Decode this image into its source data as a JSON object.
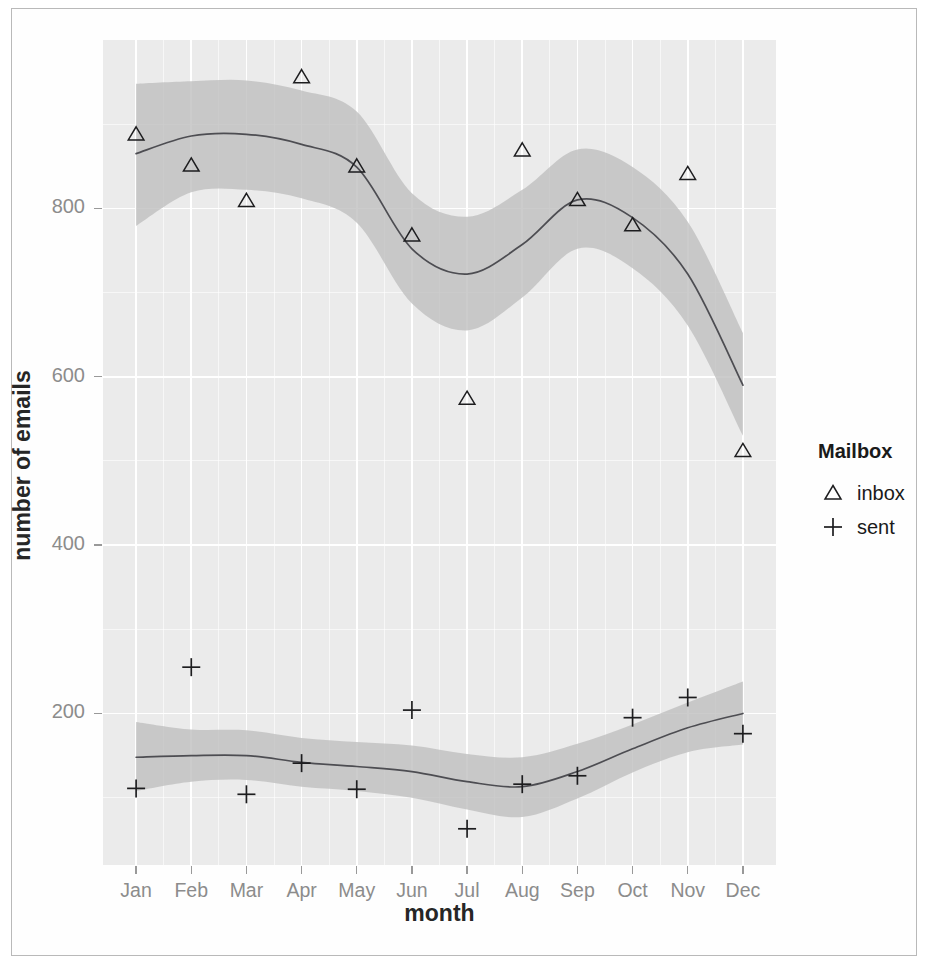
{
  "chart_data": {
    "type": "scatter",
    "title": "",
    "xlabel": "month",
    "ylabel": "number of emails",
    "categories": [
      "Jan",
      "Feb",
      "Mar",
      "Apr",
      "May",
      "Jun",
      "Jul",
      "Aug",
      "Sep",
      "Oct",
      "Nov",
      "Dec"
    ],
    "x_tick_labels": [
      "Jan",
      "Feb",
      "Mar",
      "Apr",
      "May",
      "Jun",
      "Jul",
      "Aug",
      "Sep",
      "Oct",
      "Nov",
      "Dec"
    ],
    "y_tick_labels": [
      "200",
      "400",
      "600",
      "800"
    ],
    "y_ticks": [
      200,
      400,
      600,
      800
    ],
    "ylim": [
      20,
      1000
    ],
    "xlim": [
      0.4,
      12.6
    ],
    "grid": true,
    "legend_position": "right",
    "legend_title": "Mailbox",
    "series": [
      {
        "name": "inbox",
        "marker": "triangle",
        "values": [
          888,
          851,
          809,
          956,
          850,
          768,
          574,
          869,
          810,
          780,
          841,
          512
        ],
        "smooth": [
          865,
          886,
          888,
          876,
          849,
          752,
          722,
          757,
          810,
          789,
          722,
          590
        ],
        "ribbon_lower": [
          779,
          819,
          822,
          812,
          783,
          687,
          655,
          694,
          752,
          729,
          661,
          530
        ],
        "ribbon_upper": [
          948,
          951,
          952,
          940,
          915,
          818,
          790,
          822,
          870,
          849,
          784,
          652
        ]
      },
      {
        "name": "sent",
        "marker": "plus",
        "values": [
          111,
          255,
          104,
          141,
          110,
          204,
          63,
          116,
          126,
          195,
          219,
          176
        ],
        "smooth": [
          148,
          150,
          150,
          142,
          137,
          131,
          119,
          113,
          131,
          158,
          183,
          200
        ],
        "ribbon_lower": [
          108,
          119,
          121,
          113,
          108,
          100,
          86,
          77,
          99,
          130,
          154,
          163
        ],
        "ribbon_upper": [
          190,
          181,
          180,
          171,
          166,
          162,
          152,
          148,
          164,
          187,
          213,
          238
        ]
      }
    ],
    "legend_entries": [
      {
        "label": "inbox",
        "marker": "triangle"
      },
      {
        "label": "sent",
        "marker": "plus"
      }
    ],
    "colors": {
      "panel_background": "#ebebeb",
      "gridline": "#ffffff",
      "ribbon": "#bfbfbf",
      "trend_line": "#4d4d52",
      "marker": "#1d1d1f",
      "axis_text": "#8c8c8c",
      "axis_title": "#262626"
    }
  }
}
